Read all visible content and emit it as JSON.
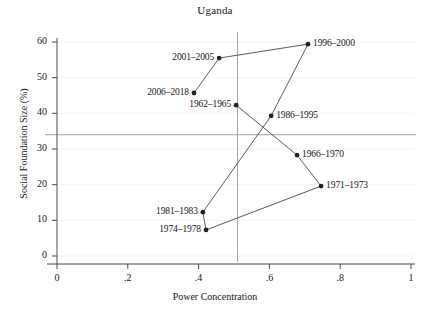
{
  "chart_data": {
    "type": "scatter",
    "title": "Uganda",
    "xlabel": "Power Concentration",
    "ylabel": "Social Foundation Size (%)",
    "xlim": [
      0,
      1
    ],
    "ylim": [
      0,
      60
    ],
    "xticks": [
      "0",
      ".2",
      ".4",
      ".6",
      ".8",
      "1"
    ],
    "xtick_values": [
      0,
      0.2,
      0.4,
      0.6,
      0.8,
      1
    ],
    "yticks": [
      "0",
      "10",
      "20",
      "30",
      "40",
      "50",
      "60"
    ],
    "ytick_values": [
      0,
      10,
      20,
      30,
      40,
      50,
      60
    ],
    "grid": false,
    "legend": "none",
    "connected": true,
    "marker": "filled-circle",
    "reference_lines": {
      "vertical_x": 0.51,
      "horizontal_y": 34
    },
    "points": [
      {
        "label": "1962–1965",
        "x": 0.506,
        "y": 42.3,
        "label_side": "left"
      },
      {
        "label": "1966–1970",
        "x": 0.678,
        "y": 28.3,
        "label_side": "right"
      },
      {
        "label": "1971–1973",
        "x": 0.746,
        "y": 19.6,
        "label_side": "right"
      },
      {
        "label": "1974–1978",
        "x": 0.421,
        "y": 7.3,
        "label_side": "left"
      },
      {
        "label": "1981–1983",
        "x": 0.412,
        "y": 12.3,
        "label_side": "left"
      },
      {
        "label": "1986–1995",
        "x": 0.605,
        "y": 39.3,
        "label_side": "right"
      },
      {
        "label": "1996–2000",
        "x": 0.709,
        "y": 59.4,
        "label_side": "right"
      },
      {
        "label": "2001–2005",
        "x": 0.458,
        "y": 55.5,
        "label_side": "left"
      },
      {
        "label": "2006–2018",
        "x": 0.387,
        "y": 45.7,
        "label_side": "left"
      }
    ],
    "path_order": [
      "1962–1965",
      "1966–1970",
      "1971–1973",
      "1974–1978",
      "1981–1983",
      "1986–1995",
      "1996–2000",
      "2001–2005",
      "2006–2018"
    ],
    "colors": {
      "line": "#555f66",
      "marker": "#222222",
      "axis": "#4a4a4a",
      "reference_line": "#9aa2a8",
      "text": "#161616",
      "background": "#ffffff"
    }
  }
}
